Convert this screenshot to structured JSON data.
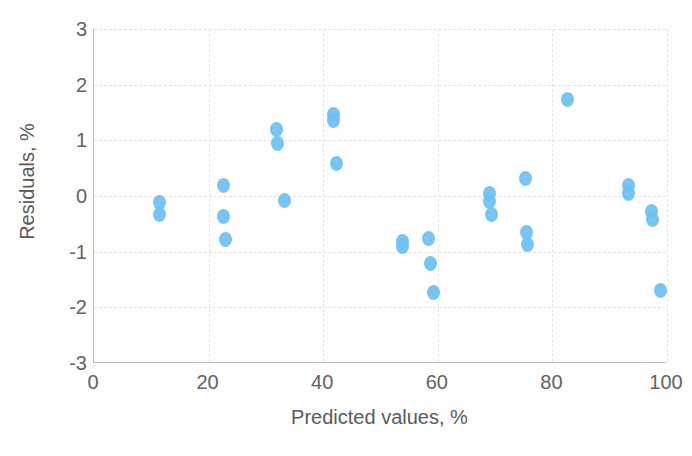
{
  "chart_data": {
    "type": "scatter",
    "title": "",
    "xlabel": "Predicted values, %",
    "ylabel": "Residuals, %",
    "xlim": [
      0,
      100
    ],
    "ylim": [
      -3,
      3
    ],
    "xticks": [
      "0",
      "20",
      "40",
      "60",
      "80",
      "100"
    ],
    "xtick_values": [
      0,
      20,
      40,
      60,
      80,
      100
    ],
    "yticks": [
      "3",
      "2",
      "1",
      "0",
      "-1",
      "-2",
      "-3"
    ],
    "ytick_values": [
      3,
      2,
      1,
      0,
      -1,
      -2,
      -3
    ],
    "grid": true,
    "grid_style": "dashed",
    "legend": null,
    "marker_color": "#6ec0f0",
    "marker_shape": "circle",
    "series": [
      {
        "name": "Residuals",
        "points": [
          {
            "x": 11.5,
            "y": -0.12
          },
          {
            "x": 11.5,
            "y": -0.33
          },
          {
            "x": 22.6,
            "y": 0.18
          },
          {
            "x": 22.6,
            "y": -0.37
          },
          {
            "x": 22.9,
            "y": -0.79
          },
          {
            "x": 31.8,
            "y": 1.19
          },
          {
            "x": 32.0,
            "y": 0.95
          },
          {
            "x": 33.2,
            "y": -0.08
          },
          {
            "x": 41.8,
            "y": 1.47
          },
          {
            "x": 41.8,
            "y": 1.35
          },
          {
            "x": 42.4,
            "y": 0.59
          },
          {
            "x": 53.8,
            "y": -0.82
          },
          {
            "x": 53.8,
            "y": -0.9
          },
          {
            "x": 58.4,
            "y": -0.76
          },
          {
            "x": 58.8,
            "y": -1.21
          },
          {
            "x": 59.2,
            "y": -1.73
          },
          {
            "x": 69.0,
            "y": 0.04
          },
          {
            "x": 69.0,
            "y": -0.09
          },
          {
            "x": 69.3,
            "y": -0.33
          },
          {
            "x": 75.3,
            "y": 0.31
          },
          {
            "x": 75.4,
            "y": -0.65
          },
          {
            "x": 75.6,
            "y": -0.87
          },
          {
            "x": 82.7,
            "y": 1.74
          },
          {
            "x": 93.2,
            "y": 0.18
          },
          {
            "x": 93.3,
            "y": 0.04
          },
          {
            "x": 97.3,
            "y": -0.27
          },
          {
            "x": 97.5,
            "y": -0.43
          },
          {
            "x": 98.8,
            "y": -1.69
          }
        ]
      }
    ]
  }
}
